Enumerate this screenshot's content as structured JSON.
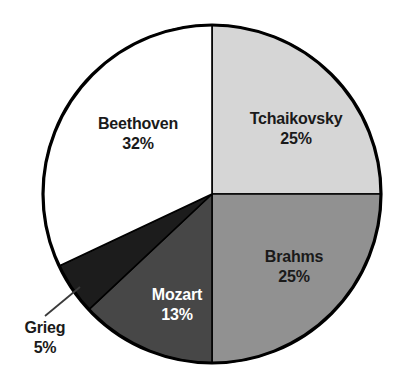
{
  "chart_data": {
    "type": "pie",
    "title": "",
    "subtitle": "",
    "xlabel": "",
    "ylabel": "",
    "legend_position": "none",
    "grid": false,
    "value_unit": "%",
    "start_angle_deg": 0,
    "direction": "clockwise",
    "categories": [
      "Tchaikovsky",
      "Brahms",
      "Mozart",
      "Grieg",
      "Beethoven"
    ],
    "values": [
      25,
      25,
      13,
      5,
      32
    ],
    "slices": [
      {
        "label": "Tchaikovsky",
        "value": 25,
        "value_text": "25%",
        "color": "#d6d6d6",
        "text_color": "#1a1a1a",
        "start_deg": 0,
        "end_deg": 90,
        "label_placement": "inside"
      },
      {
        "label": "Brahms",
        "value": 25,
        "value_text": "25%",
        "color": "#919191",
        "text_color": "#1a1a1a",
        "start_deg": 90,
        "end_deg": 180,
        "label_placement": "inside"
      },
      {
        "label": "Mozart",
        "value": 13,
        "value_text": "13%",
        "color": "#474747",
        "text_color": "#ffffff",
        "start_deg": 180,
        "end_deg": 226.8,
        "label_placement": "inside"
      },
      {
        "label": "Grieg",
        "value": 5,
        "value_text": "5%",
        "color": "#1c1c1c",
        "text_color": "#1a1a1a",
        "start_deg": 226.8,
        "end_deg": 244.8,
        "label_placement": "outside-leader"
      },
      {
        "label": "Beethoven",
        "value": 32,
        "value_text": "32%",
        "color": "#ffffff",
        "text_color": "#1a1a1a",
        "start_deg": 244.8,
        "end_deg": 360,
        "label_placement": "inside"
      }
    ],
    "outline_color": "#000000",
    "background": "#ffffff"
  },
  "geometry": {
    "center_x": 212,
    "center_y": 194,
    "radius": 169
  }
}
